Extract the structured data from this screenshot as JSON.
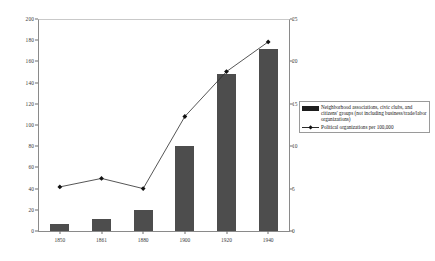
{
  "chart_data": {
    "type": "bar",
    "title": "",
    "subtitle": "",
    "xlabel": "",
    "ylabel": "",
    "categories": [
      "1850",
      "1861",
      "1880",
      "1900",
      "1920",
      "1940"
    ],
    "grid": false,
    "legend_position": "right",
    "axes": {
      "left": {
        "label": "",
        "min": 0,
        "max": 200,
        "step": 20,
        "ticks": [
          "0",
          "20",
          "40",
          "60",
          "80",
          "100",
          "120",
          "140",
          "160",
          "180",
          "200"
        ]
      },
      "right": {
        "label": "",
        "min": 0,
        "max": 25,
        "step": 5,
        "ticks": [
          "0",
          "5",
          "10",
          "15",
          "20",
          "25"
        ]
      }
    },
    "series": [
      {
        "name": "Neighborhood associations, civic clubs, and citizens' groups (not including business/trade/labor organizations)",
        "type": "bar",
        "axis": "left",
        "color": "#4d4d4d",
        "values": [
          7,
          11,
          20,
          80,
          148,
          172
        ]
      },
      {
        "name": "Political organizations per 100,000",
        "type": "line",
        "axis": "right",
        "color": "#2b2b2b",
        "marker": "diamond",
        "values": [
          5.2,
          6.2,
          5.0,
          13.5,
          18.8,
          22.3
        ]
      }
    ]
  },
  "legend": {
    "entries": [
      {
        "marker": "bar-swatch",
        "label": "Neighborhood associations, civic clubs, and citizens' groups (not including business/trade/labor organizations)"
      },
      {
        "marker": "line-marker",
        "label": "Political organizations per 100,000"
      }
    ]
  }
}
